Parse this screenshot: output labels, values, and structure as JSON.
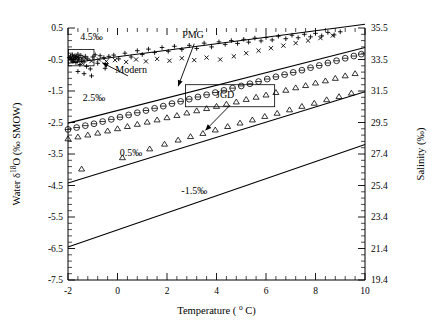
{
  "chart_data": {
    "type": "line",
    "title": "",
    "xlabel": "Temperature ( ° C)",
    "ylabel": "Water δ 18O (‰ SMOW)",
    "y2label": "Salinity (‰)",
    "xlim": [
      -2,
      10
    ],
    "ylim": [
      -7.5,
      0.5
    ],
    "y2lim": [
      19.4,
      35.5
    ],
    "xticks": [
      -2,
      0,
      2,
      4,
      6,
      8,
      10
    ],
    "xticklabels": [
      "-2",
      "0",
      "2",
      "4",
      "6",
      "8",
      "10"
    ],
    "yticks": [
      0.5,
      -0.5,
      -1.5,
      -2.5,
      -3.5,
      -4.5,
      -5.5,
      -6.5,
      -7.5
    ],
    "yticklabels": [
      "0.5",
      "-0.5",
      "-1.5",
      "-2.5",
      "-3.5",
      "-4.5",
      "-5.5",
      "-6.5",
      "-7.5"
    ],
    "y2ticks": [
      35.5,
      33.5,
      31.5,
      29.5,
      27.4,
      25.4,
      23.4,
      21.4,
      19.4
    ],
    "y2ticklabels": [
      "35.5",
      "33.5",
      "31.5",
      "29.5",
      "27.4",
      "25.4",
      "23.4",
      "21.4",
      "19.4"
    ],
    "grid": false,
    "legend_position": "none",
    "minor_ticks_per_major_x": 4,
    "minor_ticks_per_major_y": 4,
    "series": [
      {
        "name": "4.5‰",
        "kind": "line",
        "label": "4.5‰",
        "label_x": -1.05,
        "label_y": 0.12,
        "x": [
          -2,
          10
        ],
        "y": [
          -0.62,
          0.62
        ]
      },
      {
        "name": "2.5‰",
        "kind": "line",
        "label": "2.5‰",
        "label_x": -0.95,
        "label_y": -1.82,
        "x": [
          -2,
          10
        ],
        "y": [
          -2.52,
          -0.12
        ]
      },
      {
        "name": "0.5‰",
        "kind": "line",
        "label": "0.5‰",
        "label_x": 0.55,
        "label_y": -3.55,
        "x": [
          -2,
          10
        ],
        "y": [
          -4.42,
          -1.52
        ]
      },
      {
        "name": "-1.5‰",
        "kind": "line",
        "label": "-1.5‰",
        "label_x": 3.1,
        "label_y": -4.78,
        "x": [
          -2,
          10
        ],
        "y": [
          -6.45,
          -3.2
        ]
      },
      {
        "name": "PMG",
        "kind": "scatter",
        "marker": "circle-bar",
        "label": "PMG",
        "label_x": 3.05,
        "label_y": 0.18,
        "points": [
          [
            -2.0,
            -2.72
          ],
          [
            -1.65,
            -2.66
          ],
          [
            -1.3,
            -2.6
          ],
          [
            -0.95,
            -2.54
          ],
          [
            -0.6,
            -2.47
          ],
          [
            -0.25,
            -2.4
          ],
          [
            0.1,
            -2.33
          ],
          [
            0.45,
            -2.26
          ],
          [
            0.8,
            -2.19
          ],
          [
            1.15,
            -2.12
          ],
          [
            1.5,
            -2.05
          ],
          [
            1.85,
            -1.98
          ],
          [
            2.2,
            -1.9
          ],
          [
            2.55,
            -1.83
          ],
          [
            2.9,
            -1.76
          ],
          [
            3.25,
            -1.69
          ],
          [
            3.6,
            -1.62
          ],
          [
            3.95,
            -1.55
          ],
          [
            4.3,
            -1.48
          ],
          [
            4.65,
            -1.41
          ],
          [
            5.0,
            -1.34
          ],
          [
            5.35,
            -1.27
          ],
          [
            5.7,
            -1.2
          ],
          [
            6.05,
            -1.12
          ],
          [
            6.4,
            -1.05
          ],
          [
            6.75,
            -0.98
          ],
          [
            7.1,
            -0.91
          ],
          [
            7.45,
            -0.84
          ],
          [
            7.8,
            -0.76
          ],
          [
            8.15,
            -0.69
          ],
          [
            8.5,
            -0.61
          ],
          [
            8.85,
            -0.54
          ],
          [
            9.2,
            -0.46
          ],
          [
            9.55,
            -0.39
          ],
          [
            9.85,
            -0.33
          ]
        ]
      },
      {
        "name": "JGD",
        "kind": "scatter",
        "marker": "triangle",
        "label": "JGD",
        "label_x": 4.35,
        "label_y": -1.72,
        "points": [
          [
            -2.0,
            -3.02
          ],
          [
            -1.6,
            -2.96
          ],
          [
            -1.2,
            -2.9
          ],
          [
            -0.8,
            -2.84
          ],
          [
            -0.4,
            -2.77
          ],
          [
            0.0,
            -2.7
          ],
          [
            0.4,
            -2.63
          ],
          [
            0.8,
            -2.56
          ],
          [
            1.2,
            -2.49
          ],
          [
            1.6,
            -2.42
          ],
          [
            2.0,
            -2.35
          ],
          [
            2.4,
            -2.28
          ],
          [
            2.8,
            -2.2
          ],
          [
            3.2,
            -2.13
          ],
          [
            3.6,
            -2.06
          ],
          [
            4.0,
            -1.99
          ],
          [
            4.4,
            -1.92
          ],
          [
            4.8,
            -1.85
          ],
          [
            5.2,
            -1.77
          ],
          [
            5.6,
            -1.7
          ],
          [
            6.0,
            -1.63
          ],
          [
            6.4,
            -1.55
          ],
          [
            6.8,
            -1.48
          ],
          [
            7.2,
            -1.4
          ],
          [
            7.6,
            -1.33
          ],
          [
            8.0,
            -1.25
          ],
          [
            8.4,
            -1.18
          ],
          [
            8.8,
            -1.1
          ],
          [
            9.2,
            -1.02
          ],
          [
            9.6,
            -0.95
          ],
          [
            -1.45,
            -3.98
          ],
          [
            0.2,
            -3.62
          ],
          [
            1.3,
            -3.34
          ],
          [
            1.9,
            -3.19
          ],
          [
            2.45,
            -3.06
          ],
          [
            2.95,
            -2.95
          ],
          [
            3.45,
            -2.85
          ],
          [
            3.95,
            -2.74
          ],
          [
            4.45,
            -2.63
          ],
          [
            4.95,
            -2.52
          ],
          [
            5.45,
            -2.42
          ],
          [
            5.95,
            -2.31
          ],
          [
            6.45,
            -2.21
          ],
          [
            6.95,
            -2.1
          ],
          [
            7.45,
            -1.99
          ],
          [
            7.95,
            -1.89
          ],
          [
            8.45,
            -1.78
          ],
          [
            8.95,
            -1.68
          ],
          [
            9.45,
            -1.57
          ]
        ]
      },
      {
        "name": "Modern",
        "kind": "scatter",
        "marker": "plus-and-cross",
        "label": "Modern",
        "label_x": 0.55,
        "label_y": -0.93,
        "points_plus": [
          [
            -1.95,
            -0.44
          ],
          [
            -1.9,
            -0.39
          ],
          [
            -1.88,
            -0.52
          ],
          [
            -1.85,
            -0.47
          ],
          [
            -1.82,
            -0.35
          ],
          [
            -1.8,
            -0.56
          ],
          [
            -1.78,
            -0.43
          ],
          [
            -1.75,
            -0.5
          ],
          [
            -1.72,
            -0.38
          ],
          [
            -1.7,
            -0.46
          ],
          [
            -1.68,
            -0.6
          ],
          [
            -1.65,
            -0.41
          ],
          [
            -1.62,
            -0.55
          ],
          [
            -1.6,
            -0.33
          ],
          [
            -1.58,
            -0.49
          ],
          [
            -1.55,
            -0.44
          ],
          [
            -1.52,
            -0.66
          ],
          [
            -1.48,
            -0.37
          ],
          [
            -1.45,
            -0.52
          ],
          [
            -1.4,
            -0.45
          ],
          [
            -1.35,
            -0.58
          ],
          [
            -1.3,
            -0.4
          ],
          [
            -1.25,
            -0.72
          ],
          [
            -1.2,
            -0.48
          ],
          [
            -1.1,
            -0.8
          ],
          [
            -1.0,
            -0.42
          ],
          [
            -0.9,
            -0.35
          ],
          [
            -0.8,
            -0.62
          ],
          [
            -0.7,
            -0.38
          ],
          [
            -0.55,
            -0.44
          ],
          [
            -0.35,
            -0.4
          ],
          [
            -0.15,
            -0.36
          ],
          [
            0.05,
            -0.48
          ],
          [
            0.3,
            -0.3
          ],
          [
            0.55,
            -0.42
          ],
          [
            0.8,
            -0.22
          ],
          [
            1.0,
            -0.34
          ],
          [
            1.25,
            -0.17
          ],
          [
            1.5,
            -0.28
          ],
          [
            1.8,
            -0.12
          ],
          [
            2.05,
            -0.24
          ],
          [
            2.3,
            -0.08
          ],
          [
            2.6,
            -0.18
          ],
          [
            2.9,
            -0.05
          ],
          [
            3.2,
            -0.15
          ],
          [
            3.5,
            0.02
          ],
          [
            3.8,
            -0.1
          ],
          [
            4.1,
            0.06
          ],
          [
            4.35,
            -0.02
          ],
          [
            4.6,
            0.1
          ],
          [
            4.85,
            0.01
          ],
          [
            5.1,
            0.14
          ],
          [
            5.3,
            0.05
          ],
          [
            5.55,
            0.18
          ],
          [
            5.8,
            0.09
          ],
          [
            6.0,
            0.2
          ],
          [
            6.25,
            0.12
          ],
          [
            6.5,
            0.24
          ],
          [
            6.8,
            0.16
          ],
          [
            7.05,
            0.27
          ],
          [
            7.3,
            0.19
          ],
          [
            7.55,
            0.3
          ],
          [
            7.8,
            0.22
          ],
          [
            8.0,
            0.33
          ],
          [
            8.25,
            0.25
          ],
          [
            8.5,
            0.36
          ],
          [
            8.75,
            0.28
          ],
          [
            9.0,
            0.38
          ],
          [
            -1.6,
            -0.88
          ],
          [
            -1.35,
            -0.95
          ],
          [
            -1.05,
            -1.02
          ],
          [
            -0.5,
            -0.78
          ]
        ],
        "points_cross": [
          [
            -1.9,
            -0.46
          ],
          [
            -1.78,
            -0.54
          ],
          [
            -1.62,
            -0.42
          ],
          [
            -1.45,
            -0.6
          ],
          [
            -1.28,
            -0.47
          ],
          [
            -1.05,
            -0.55
          ],
          [
            -0.75,
            -0.5
          ],
          [
            -0.45,
            -0.56
          ],
          [
            -0.1,
            -0.52
          ],
          [
            0.35,
            -0.58
          ],
          [
            0.75,
            -0.5
          ],
          [
            1.15,
            -0.56
          ],
          [
            1.6,
            -0.48
          ],
          [
            2.1,
            -0.54
          ],
          [
            2.6,
            -0.46
          ],
          [
            3.1,
            -0.52
          ],
          [
            3.6,
            -0.44
          ],
          [
            4.15,
            -0.5
          ],
          [
            4.7,
            -0.4
          ],
          [
            5.2,
            -0.3
          ],
          [
            5.7,
            -0.22
          ],
          [
            6.2,
            -0.14
          ],
          [
            6.7,
            -0.06
          ],
          [
            7.2,
            0.02
          ],
          [
            7.7,
            0.1
          ],
          [
            8.2,
            0.18
          ],
          [
            8.7,
            0.26
          ]
        ]
      }
    ],
    "annotation_boxes": [
      {
        "name": "modern-cluster-box",
        "x0": -1.98,
        "x1": -0.95,
        "y0": -0.7,
        "y1": -0.18
      },
      {
        "name": "pmg-cluster-box",
        "x0": 2.75,
        "x1": 6.35,
        "y0": -2.0,
        "y1": -1.3
      }
    ],
    "annotation_arrows": [
      {
        "name": "modern-arrow",
        "from_x": 0.42,
        "from_y": -1.02,
        "to_x": -0.62,
        "to_y": -0.6
      },
      {
        "name": "pmg-arrow",
        "from_x": 3.1,
        "from_y": 0.0,
        "to_x": 2.45,
        "to_y": -1.35
      },
      {
        "name": "jgd-arrow",
        "from_x": 4.55,
        "from_y": -1.95,
        "to_x": 3.55,
        "to_y": -2.75
      }
    ]
  },
  "figure": {
    "axis_titles": {
      "x": "Temperature ( ° C)",
      "x_parts": {
        "lead": "Temperature (",
        "deg": "o",
        "unit": "C)"
      },
      "y_parts": {
        "lead": "Water ",
        "delta": "δ",
        "sup": "18",
        "o": "O (‰ SMOW)"
      },
      "y2": "Salinity (‰)"
    }
  }
}
